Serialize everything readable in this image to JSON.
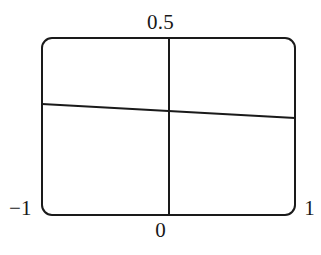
{
  "figure": {
    "name": "line-plot-figure",
    "background_color": "#ffffff",
    "stroke_color": "#1a1a1a",
    "width": 321,
    "height": 255
  },
  "axis_labels": {
    "y_max": "0.5",
    "x_zero": "0",
    "x_min": "−1",
    "x_max": "1"
  },
  "chart_data": {
    "type": "line",
    "title": "",
    "xlabel": "",
    "ylabel": "",
    "xlim": [
      -1,
      1
    ],
    "ylim": [
      -0.5,
      0.5
    ],
    "grid": false,
    "legend": null,
    "frame": {
      "style": "rounded-rectangle",
      "corner_radius": 10,
      "line_width": 2,
      "left_px": 42,
      "right_px": 295,
      "top_px": 38,
      "bottom_px": 215
    },
    "axes_lines": [
      {
        "name": "vertical-axis-x0",
        "orientation": "vertical",
        "x_value": 0,
        "x_px": 169,
        "from_y_px": 38,
        "to_y_px": 215
      }
    ],
    "tick_labels": {
      "x": [
        "−1",
        "0",
        "1"
      ],
      "x_values": [
        -1,
        0,
        1
      ],
      "y": [
        "0.5"
      ],
      "y_values": [
        0.5
      ]
    },
    "series": [
      {
        "name": "curve",
        "x": [
          -1.0,
          -0.75,
          -0.5,
          -0.25,
          0.0,
          0.25,
          0.5,
          0.75,
          1.0
        ],
        "y": [
          0.0789,
          0.0691,
          0.0592,
          0.0494,
          0.0395,
          0.0296,
          0.0198,
          0.0099,
          0.0
        ],
        "points_px": [
          [
            42,
            104
          ],
          [
            73.6,
            105.8
          ],
          [
            105.3,
            107.5
          ],
          [
            137,
            109.3
          ],
          [
            168.5,
            111.0
          ],
          [
            200.1,
            112.8
          ],
          [
            231.8,
            114.5
          ],
          [
            263.4,
            116.3
          ],
          [
            295,
            118
          ]
        ],
        "line_width": 2,
        "color": "#1a1a1a"
      }
    ]
  }
}
